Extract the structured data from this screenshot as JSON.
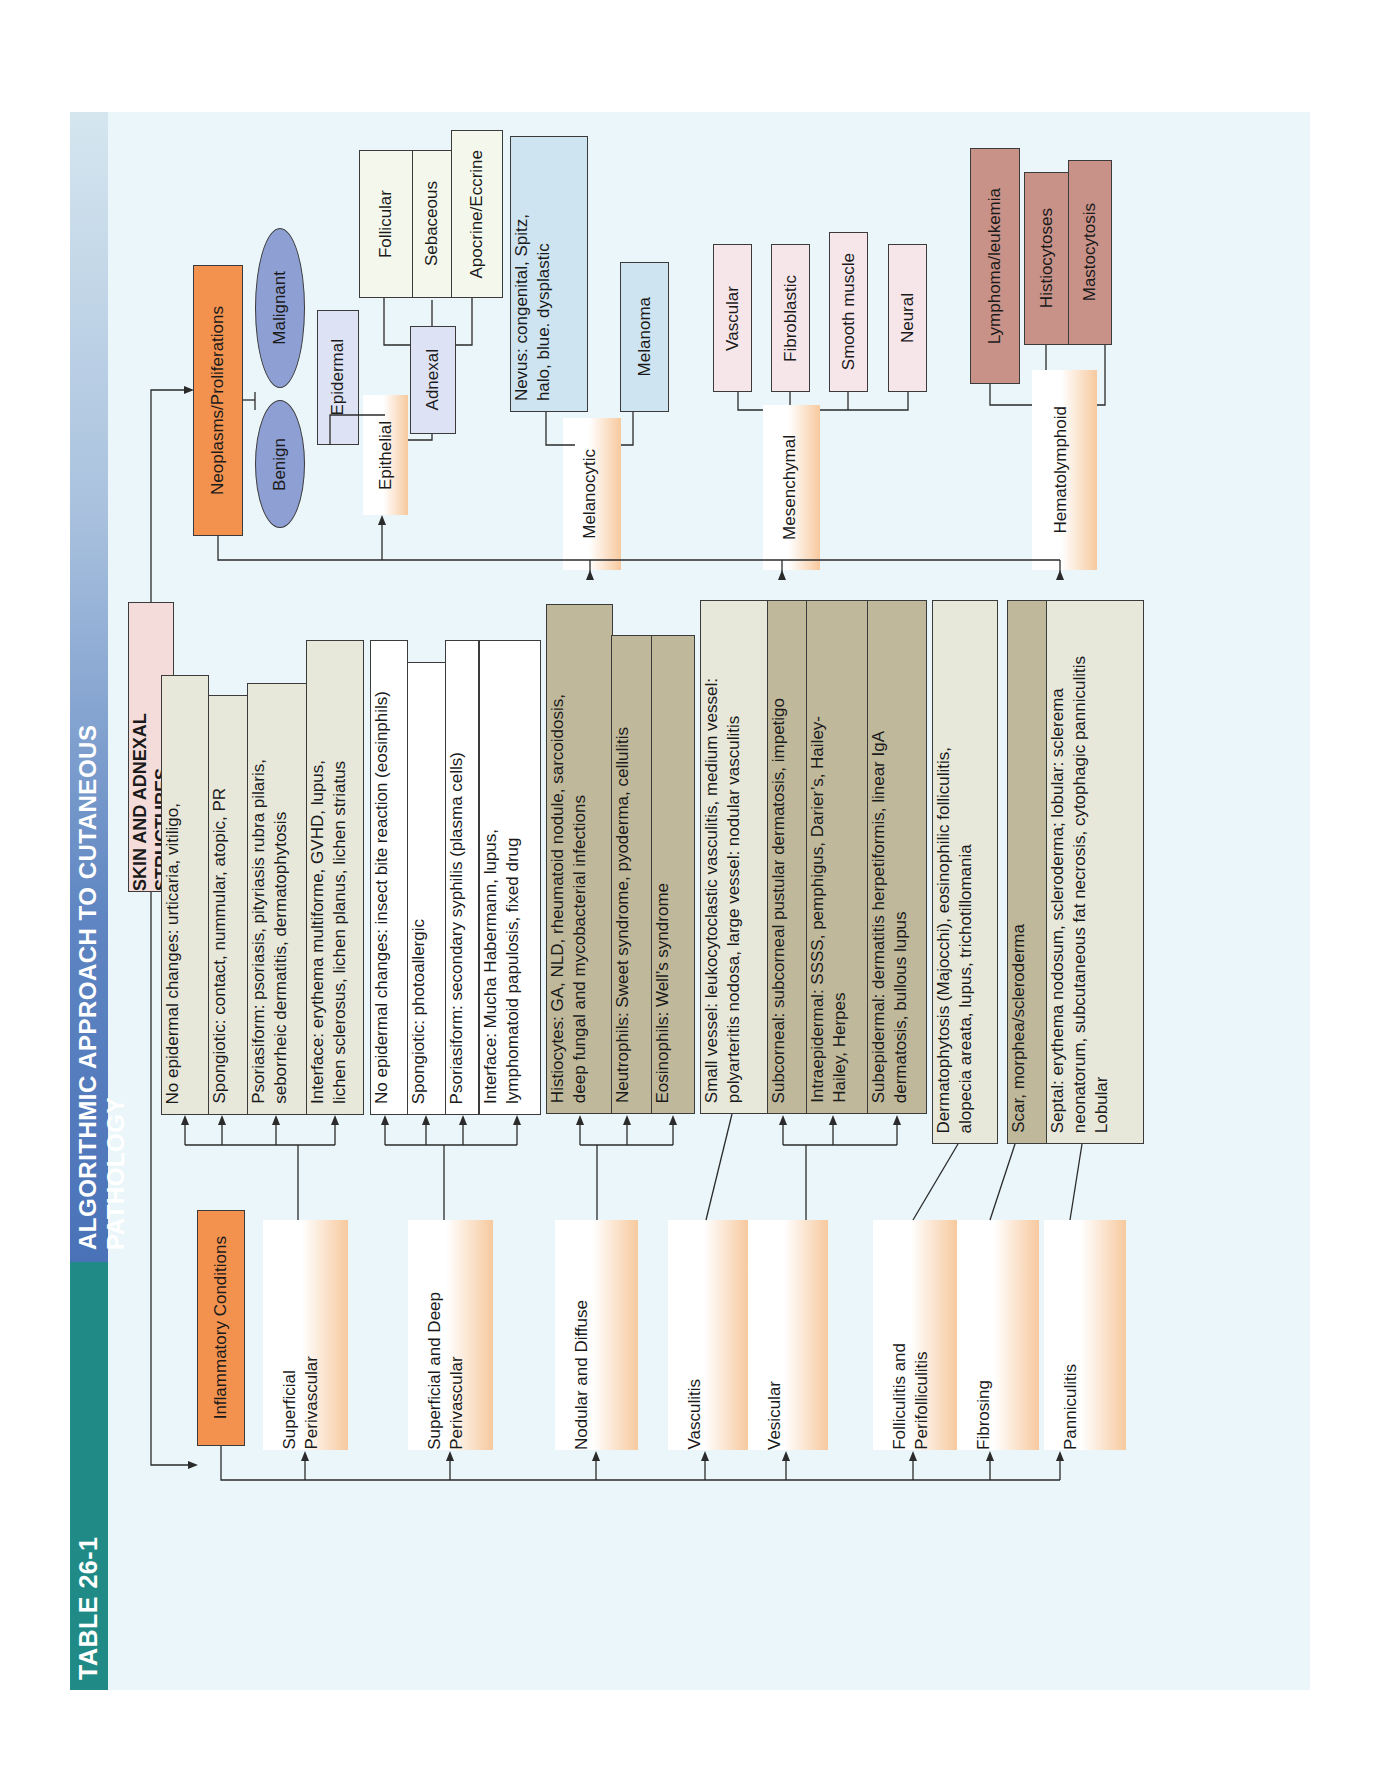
{
  "header": {
    "table_number": "TABLE 26-1",
    "title": "ALGORITHMIC APPROACH TO CUTANEOUS PATHOLOGY"
  },
  "root": {
    "label": "SKIN AND ADNEXAL STRUCTURES"
  },
  "inflammatory": {
    "label": "Inflammatory Conditions",
    "patterns": [
      {
        "label": "Superficial\nPerivascular",
        "findings": [
          "No epidermal changes: urticaria, vitiligo,",
          "Spongiotic: contact, nummular, atopic, PR",
          "Psoriasiform: psoriasis, pityriasis rubra pilaris,\nseborrheic dermatitis, dermatophytosis",
          "Interface: erythema multiforme, GVHD, lupus,\nlichen sclerosus, lichen planus, lichen striatus"
        ]
      },
      {
        "label": "Superficial and Deep\nPerivascular",
        "findings": [
          "No epidermal changes: insect bite reaction (eosinphils)",
          "Spongiotic: photoallergic",
          "Psoriasiform: secondary syphilis (plasma cells)",
          "Interface: Mucha Habermann, lupus,\nlymphomatoid papulosis, fixed drug"
        ]
      },
      {
        "label": "Nodular and Diffuse",
        "findings": [
          "Histiocytes: GA, NLD, rheumatoid nodule, sarcoidosis,\ndeep fungal and mycobacterial infections",
          "Neutrophils: Sweet syndrome, pyoderma, cellulitis",
          "Eosinophils: Well’s syndrome"
        ]
      },
      {
        "label": "Vasculitis",
        "findings": [
          "Small vessel: leukocytoclastic vasculitis, medium vessel:\npolyarteritis nodosa, large vessel: nodular vasculitis"
        ]
      },
      {
        "label": "Vesicular",
        "findings": [
          "Subcorneal: subcorneal pustular dermatosis, impetigo",
          "Intraepidermal: SSSS, pemphigus, Darier’s, Hailey-\nHailey, Herpes",
          "Subepidermal: dermatitis herpetiformis, linear IgA\ndermatosis, bullous lupus"
        ]
      },
      {
        "label": "Folliculitis and\nPerifolliculitis",
        "findings": [
          "Dermatophytosis (Majocchi), eosinophilic folliculitis,\nalopecia areata, lupus, trichotillomania"
        ]
      },
      {
        "label": "Fibrosing",
        "findings": [
          "Scar, morphea/scleroderma"
        ]
      },
      {
        "label": "Panniculitis",
        "findings": [
          "Septal: erythema nodosum, scleroderma; lobular: sclerema\nneonatorum, subcutaneous fat necrosis, cytophagic panniculitis\nLobular"
        ]
      }
    ]
  },
  "neoplasms": {
    "label": "Neoplasms/Proliferations",
    "behavior": [
      "Benign",
      "Malignant"
    ],
    "lineages": [
      {
        "label": "Epithelial",
        "children": [
          {
            "label": "Epidermal"
          },
          {
            "label": "Adnexal",
            "children": [
              "Follicular",
              "Sebaceous",
              "Apocrine/Eccrine"
            ]
          }
        ]
      },
      {
        "label": "Melanocytic",
        "children": [
          "Nevus: congenital, Spitz,\nhalo, blue. dysplastic",
          "Melanoma"
        ]
      },
      {
        "label": "Mesenchymal",
        "children": [
          "Vascular",
          "Fibroblastic",
          "Smooth muscle",
          "Neural"
        ]
      },
      {
        "label": "Hematolymphoid",
        "children": [
          "Lymphoma/leukemia",
          "Histiocytoses",
          "Mastocytosis"
        ]
      }
    ]
  },
  "colors": {
    "title_teal": "#1f8a86",
    "title_blue": "#4a72b8",
    "category_orange": "#f2924e",
    "root_pink": "#f3dcd9",
    "page_bg": "#eaf6f9",
    "oval_blue": "#8e9fd3",
    "hemato_rose": "#c99288"
  }
}
